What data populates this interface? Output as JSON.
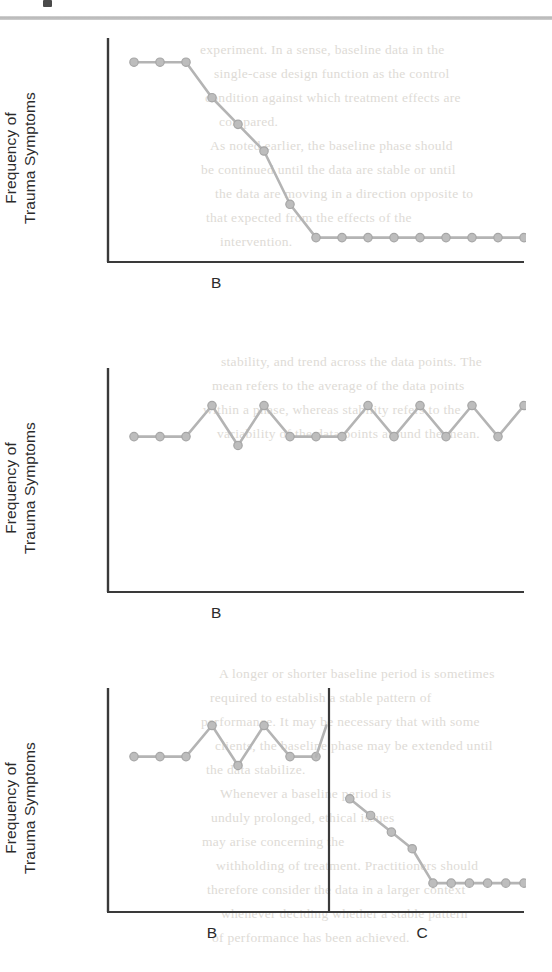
{
  "page": {
    "header_glyph": "partial-letter-mark",
    "background_text_lines": [
      "experiment.   In a sense, baseline data in the",
      "single-case design function as the control",
      "condition against which treatment effects are",
      "compared.",
      "As noted earlier, the baseline phase should",
      "be continued until the data are stable or until",
      "the data are moving in a direction opposite to",
      "that expected from the effects of the",
      "intervention.",
      "",
      "",
      "",
      "",
      "stability, and trend across the data points. The",
      "mean refers to the average of the data points",
      "within a phase, whereas stability refers to the",
      "variability of the data points around the mean.",
      "",
      "",
      "",
      "",
      "",
      "",
      "",
      "",
      "",
      "A longer or shorter baseline period is sometimes",
      "required to establish a stable pattern of",
      "performance.  It may be necessary that with some",
      "clients, the baseline phase may be extended until",
      "the data stabilize.",
      "Whenever a baseline period is",
      "unduly prolonged, ethical issues",
      "may arise concerning the",
      "withholding of treatment.  Practitioners should",
      "therefore consider the data in a larger context",
      "whenever deciding whether a stable pattern",
      "of performance has been achieved."
    ]
  },
  "figures": [
    {
      "id": "figure-1",
      "ylabel_line1": "Frequency of",
      "ylabel_line2": "Trauma Symptoms",
      "xlabels": [
        {
          "text": "B",
          "x_frac": 0.26
        }
      ]
    },
    {
      "id": "figure-2",
      "ylabel_line1": "Frequency of",
      "ylabel_line2": "Trauma Symptoms",
      "xlabels": [
        {
          "text": "B",
          "x_frac": 0.26
        }
      ]
    },
    {
      "id": "figure-3",
      "ylabel_line1": "Frequency of",
      "ylabel_line2": "Trauma Symptoms",
      "xlabels": [
        {
          "text": "B",
          "x_frac": 0.25
        },
        {
          "text": "C",
          "x_frac": 0.755
        }
      ]
    }
  ],
  "chart_data": [
    {
      "type": "line",
      "title": "",
      "xlabel": "B",
      "ylabel": "Frequency of Trauma Symptoms",
      "xlim": [
        0,
        16
      ],
      "ylim": [
        0,
        10
      ],
      "grid": false,
      "legend": "none",
      "axis_ticks": false,
      "phases": [
        {
          "label": "B",
          "x_start": 0,
          "x_end": 16
        }
      ],
      "series": [
        {
          "name": "Frequency of Trauma Symptoms",
          "x": [
            1,
            2,
            3,
            4,
            5,
            6,
            7,
            8,
            9,
            10,
            11,
            12,
            13,
            14,
            15,
            16
          ],
          "values": [
            9.0,
            9.0,
            9.0,
            7.4,
            6.2,
            5.0,
            2.6,
            1.1,
            1.1,
            1.1,
            1.1,
            1.1,
            1.1,
            1.1,
            1.1,
            1.1
          ]
        }
      ]
    },
    {
      "type": "line",
      "title": "",
      "xlabel": "B",
      "ylabel": "Frequency of Trauma Symptoms",
      "xlim": [
        0,
        16
      ],
      "ylim": [
        0,
        10
      ],
      "grid": false,
      "legend": "none",
      "axis_ticks": false,
      "phases": [
        {
          "label": "B",
          "x_start": 0,
          "x_end": 16
        }
      ],
      "series": [
        {
          "name": "Frequency of Trauma Symptoms",
          "x": [
            1,
            2,
            3,
            4,
            5,
            6,
            7,
            8,
            9,
            10,
            11,
            12,
            13,
            14,
            15,
            16
          ],
          "values": [
            7.0,
            7.0,
            7.0,
            8.4,
            6.6,
            8.4,
            7.0,
            7.0,
            7.0,
            8.4,
            7.0,
            8.4,
            7.0,
            8.4,
            7.0,
            8.4
          ]
        }
      ]
    },
    {
      "type": "line",
      "title": "",
      "xlabel": "B / C",
      "ylabel": "Frequency of Trauma Symptoms",
      "xlim": [
        0,
        16
      ],
      "ylim": [
        0,
        10
      ],
      "grid": false,
      "legend": "none",
      "axis_ticks": false,
      "phase_divider_x": 8.5,
      "phases": [
        {
          "label": "B",
          "x_start": 0,
          "x_end": 8.5
        },
        {
          "label": "C",
          "x_start": 8.5,
          "x_end": 16
        }
      ],
      "series": [
        {
          "name": "Phase B",
          "x": [
            1,
            2,
            3,
            4,
            5,
            6,
            7,
            8
          ],
          "values": [
            7.0,
            7.0,
            7.0,
            8.4,
            6.6,
            8.4,
            7.0,
            7.0
          ]
        },
        {
          "name": "Phase B end",
          "x": [
            8,
            8.4
          ],
          "values": [
            7.0,
            8.4
          ]
        },
        {
          "name": "Phase C",
          "x": [
            9.3,
            10.1,
            10.9,
            11.7,
            12.5,
            13.2,
            13.9,
            14.6,
            15.3,
            16.0
          ],
          "values": [
            5.1,
            4.35,
            3.6,
            2.85,
            1.3,
            1.3,
            1.3,
            1.3,
            1.3,
            1.3
          ]
        }
      ]
    }
  ]
}
